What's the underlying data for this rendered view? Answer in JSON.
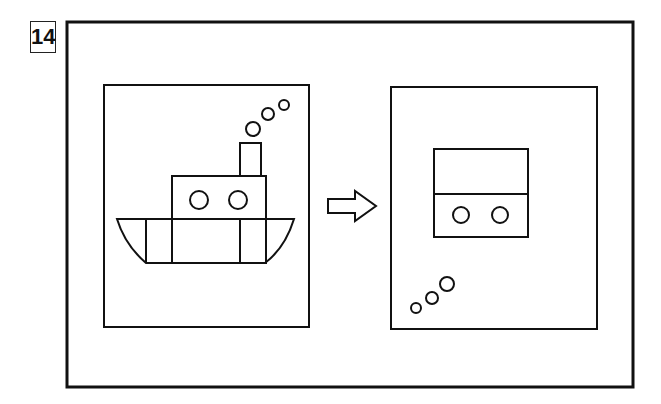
{
  "puzzle": {
    "number": "14",
    "description": "Visual transformation puzzle: boat picture transforms into rearranged picture",
    "left_panel": {
      "label": "Steamboat",
      "elements": [
        "hull",
        "cabin",
        "portholes",
        "chimney",
        "smoke-puffs"
      ]
    },
    "arrow": "right-arrow",
    "right_panel": {
      "label": "Transformed cabin",
      "elements": [
        "split-rectangle",
        "portholes",
        "smoke-puffs-bottom-left"
      ]
    },
    "colors": {
      "stroke": "#111111",
      "background": "#ffffff"
    }
  }
}
